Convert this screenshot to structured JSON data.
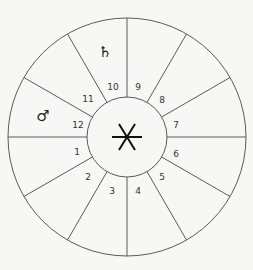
{
  "diagram": {
    "type": "astrological-house-wheel",
    "background": "#f7f7f5",
    "line_color": "#5a5a5a",
    "center": {
      "symbol_name": "asterisk-symbol"
    },
    "houses": [
      {
        "label": "1",
        "x": 77,
        "y": 152
      },
      {
        "label": "2",
        "x": 88,
        "y": 177
      },
      {
        "label": "3",
        "x": 112,
        "y": 191
      },
      {
        "label": "4",
        "x": 138,
        "y": 191
      },
      {
        "label": "5",
        "x": 162,
        "y": 177
      },
      {
        "label": "6",
        "x": 176,
        "y": 154
      },
      {
        "label": "7",
        "x": 176,
        "y": 125
      },
      {
        "label": "8",
        "x": 162,
        "y": 100
      },
      {
        "label": "9",
        "x": 138,
        "y": 87
      },
      {
        "label": "10",
        "x": 113,
        "y": 87
      },
      {
        "label": "11",
        "x": 88,
        "y": 99
      },
      {
        "label": "12",
        "x": 78,
        "y": 125
      }
    ],
    "planets": [
      {
        "name": "saturn",
        "glyph": "♄",
        "house": "10",
        "x": 105,
        "y": 52
      },
      {
        "name": "mars",
        "glyph": "♂",
        "house": "12",
        "x": 43,
        "y": 116
      }
    ]
  }
}
